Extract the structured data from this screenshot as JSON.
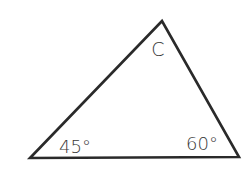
{
  "diagram": {
    "type": "triangle",
    "stroke_color": "#2a2a2a",
    "background": "#ffffff",
    "vertices": {
      "bottom_left": [
        30,
        158
      ],
      "apex": [
        162,
        21
      ],
      "bottom_right": [
        239,
        157
      ]
    },
    "labels": {
      "apex_angle": "C",
      "bottom_left_angle": "45°",
      "bottom_right_angle": "60°"
    }
  }
}
